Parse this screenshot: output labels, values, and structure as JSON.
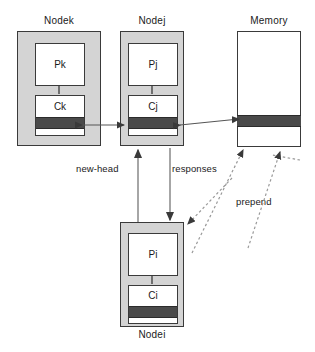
{
  "diagram": {
    "title_nodek": "Nodek",
    "title_nodej": "Nodej",
    "title_memory": "Memory",
    "title_nodei": "Nodei",
    "label_new_head": "new-head",
    "label_responses": "responses",
    "label_prepend": "prepend",
    "nodek": {
      "process_label": "Pk",
      "cache_label": "Ck"
    },
    "nodej": {
      "process_label": "Pj",
      "cache_label": "Cj"
    },
    "nodei": {
      "process_label": "Pi",
      "cache_label": "Ci"
    },
    "colors": {
      "node_fill": "#d4d4d4",
      "box_stroke": "#3a3a3a",
      "band_fill": "#4a4a4a",
      "memory_fill": "#ffffff",
      "arrow_stroke": "#555555",
      "dashed_stroke": "#777777",
      "text": "#1a1a1a"
    }
  }
}
